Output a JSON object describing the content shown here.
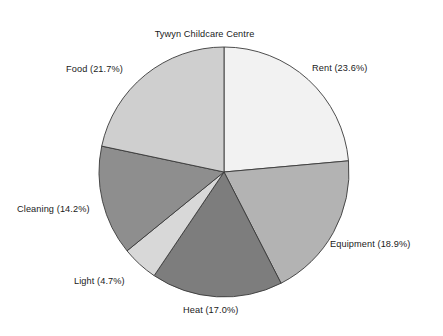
{
  "chart_data": {
    "type": "pie",
    "title": "Tywyn Childcare Centre\nBudget for 1996",
    "title_lines": [
      "Tywyn Childcare Centre",
      "Budget for 1996"
    ],
    "xlabel": "",
    "ylabel": "",
    "grid": false,
    "legend_position": "outside-labels",
    "start_angle_deg": 90,
    "direction": "clockwise",
    "units": "percent",
    "categories": [
      "Rent",
      "Equipment",
      "Heat",
      "Light",
      "Cleaning",
      "Food"
    ],
    "values": [
      23.6,
      18.9,
      17.0,
      4.7,
      14.2,
      21.7
    ],
    "labels": [
      "Rent (23.6%)",
      "Equipment (18.9%)",
      "Heat (17.0%)",
      "Light (4.7%)",
      "Cleaning (14.2%)",
      "Food (21.7%)"
    ],
    "slices": [
      {
        "name": "Rent",
        "value": 23.6,
        "label": "Rent (23.6%)",
        "color": "#f2f2f2"
      },
      {
        "name": "Equipment",
        "value": 18.9,
        "label": "Equipment (18.9%)",
        "color": "#b3b3b3"
      },
      {
        "name": "Heat",
        "value": 17.0,
        "label": "Heat (17.0%)",
        "color": "#7d7d7d"
      },
      {
        "name": "Light",
        "value": 4.7,
        "label": "Light (4.7%)",
        "color": "#d8d8d8"
      },
      {
        "name": "Cleaning",
        "value": 14.2,
        "label": "Cleaning (14.2%)",
        "color": "#8e8e8e"
      },
      {
        "name": "Food",
        "value": 21.7,
        "label": "Food (21.7%)",
        "color": "#cfcfcf"
      }
    ],
    "colors": {
      "outline": "#3a3a3a",
      "background": "#ffffff",
      "text": "#1a1a1a"
    },
    "geometry": {
      "center_x": 224,
      "center_y": 172,
      "radius": 125
    }
  }
}
